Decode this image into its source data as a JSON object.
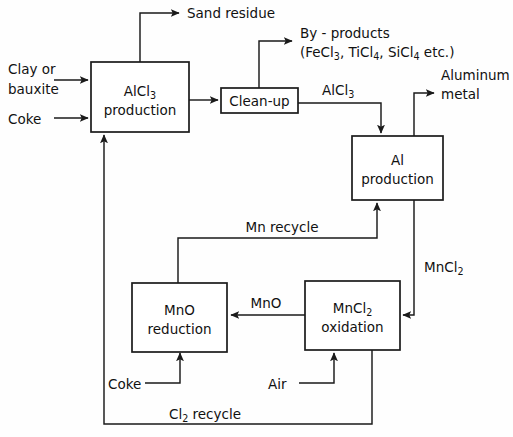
{
  "diagram": {
    "ink_color": "#1a1a1a",
    "background_color": "#ffffff",
    "boxes": [
      {
        "id": "alcl3-production",
        "line1": "AlCl",
        "line1_sub": "3",
        "line2": "production"
      },
      {
        "id": "clean-up",
        "line1": "Clean-up"
      },
      {
        "id": "al-production",
        "line1": "Al",
        "line2": "production"
      },
      {
        "id": "mno-reduction",
        "line1": "MnO",
        "line2": "reduction"
      },
      {
        "id": "mncl2-oxidation",
        "line1": "MnCl",
        "line1_sub": "2",
        "line2": "oxidation"
      }
    ],
    "labels": {
      "clay_or": "Clay or",
      "bauxite": "bauxite",
      "coke_top": "Coke",
      "sand_residue": "Sand residue",
      "by_products": "By - products",
      "by_products_formula_open": "(FeCl",
      "by_products_sub1": "3",
      "by_products_mid1": ", TiCl",
      "by_products_sub2": "4",
      "by_products_mid2": ", SiCl",
      "by_products_sub3": "4",
      "by_products_close": " etc.)",
      "alcl3_stream": "AlCl",
      "alcl3_stream_sub": "3",
      "aluminum": "Aluminum",
      "metal": "metal",
      "mn_recycle": "Mn recycle",
      "mncl2_stream": "MnCl",
      "mncl2_stream_sub": "2",
      "mno_stream": "MnO",
      "coke_bottom": "Coke",
      "air": "Air",
      "cl2_recycle": "Cl",
      "cl2_recycle_sub": "2",
      "cl2_recycle_tail": " recycle"
    }
  }
}
